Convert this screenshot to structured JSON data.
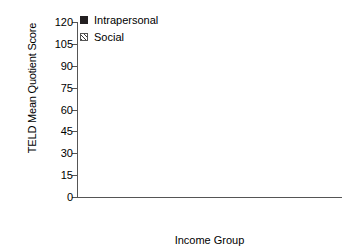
{
  "chart_data": {
    "type": "bar",
    "title": "",
    "xlabel": "Income Group",
    "ylabel": "TELD Mean Quotient Score",
    "categories": [
      "Low",
      "Middle"
    ],
    "yticks": [
      0,
      15,
      30,
      45,
      60,
      75,
      90,
      105,
      120
    ],
    "ylim": [
      0,
      120
    ],
    "grid": false,
    "legend_position": "top-left",
    "series": [
      {
        "name": "Intrapersonal",
        "fill": "solid-black",
        "color": "#231f20",
        "values": [
          97,
          107
        ],
        "errors": [
          1.5,
          2.5
        ]
      },
      {
        "name": "Social",
        "fill": "diagonal-hatch",
        "color": "#ffffff",
        "values": [
          98,
          103
        ],
        "errors": [
          2.0,
          1.5
        ]
      }
    ]
  },
  "axes": {
    "y_title": "TELD Mean Quotient Score",
    "x_title": "Income Group",
    "y_tick_labels": [
      "120",
      "105",
      "90",
      "75",
      "60",
      "45",
      "30",
      "15",
      "0"
    ]
  },
  "legend": {
    "items": [
      {
        "label": "Intrapersonal"
      },
      {
        "label": "Social"
      }
    ]
  },
  "categories": [
    {
      "label": "Low"
    },
    {
      "label": "Middle"
    }
  ]
}
